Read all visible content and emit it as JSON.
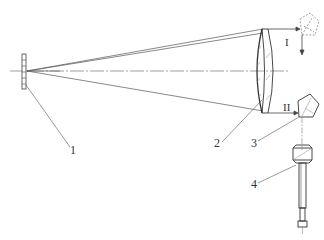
{
  "diagram": {
    "type": "optical-schematic",
    "colors": {
      "line": "#444444",
      "axis": "#777777",
      "hatch": "#888888",
      "background": "#ffffff"
    },
    "labels": {
      "part1": "1",
      "part2": "2",
      "part3": "3",
      "part4": "4",
      "pos1": "I",
      "pos2": "II"
    },
    "components": [
      {
        "id": "1",
        "name": "reticle / light source plate"
      },
      {
        "id": "2",
        "name": "objective lens (doublet)"
      },
      {
        "id": "3",
        "name": "pentaprism"
      },
      {
        "id": "4",
        "name": "eyepiece / viewing tube"
      }
    ],
    "positions": [
      {
        "id": "I",
        "name": "upper beam position (pentaprism, dashed)"
      },
      {
        "id": "II",
        "name": "lower beam position (pentaprism, solid)"
      }
    ]
  }
}
